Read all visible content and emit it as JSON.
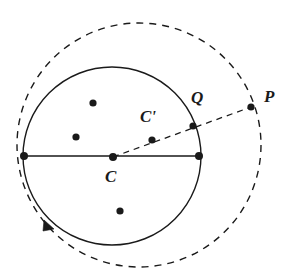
{
  "figure": {
    "background_color": "#ffffff",
    "stroke_color": "#1a1a1a",
    "width": 292,
    "height": 278
  },
  "chart_data": {
    "type": "scatter",
    "title": "",
    "xlabel": "",
    "ylabel": "",
    "grid": false,
    "legend": null,
    "shapes": [
      {
        "name": "solid-circle",
        "kind": "circle",
        "style": "solid",
        "cx": 112,
        "cy": 156,
        "r": 89,
        "stroke": "#1a1a1a",
        "stroke_width": 1.4
      },
      {
        "name": "dashed-circle",
        "kind": "circle",
        "style": "dashed",
        "cx": 139,
        "cy": 145,
        "r": 122,
        "stroke": "#1a1a1a",
        "stroke_width": 1.4
      },
      {
        "name": "diameter-segment",
        "kind": "line",
        "style": "solid",
        "x1": 24,
        "y1": 156,
        "x2": 199,
        "y2": 156,
        "stroke": "#1a1a1a",
        "stroke_width": 1.6
      },
      {
        "name": "dashed-ray-c-to-p",
        "kind": "line",
        "style": "dashed",
        "x1": 113,
        "y1": 157,
        "x2": 251,
        "y2": 107,
        "stroke": "#1a1a1a",
        "stroke_width": 1.3
      },
      {
        "name": "orientation-arrowhead",
        "kind": "arrowhead",
        "x": 52,
        "y": 227,
        "angle_deg": 55,
        "stroke": "#1a1a1a"
      }
    ],
    "points": [
      {
        "name": "point-c",
        "label": "C",
        "x": 113,
        "y": 157,
        "r": 4.0,
        "labeled": true
      },
      {
        "name": "point-c-prime",
        "label": "C'",
        "x": 152,
        "y": 140,
        "r": 3.6,
        "labeled": true
      },
      {
        "name": "point-q",
        "label": "Q",
        "x": 193,
        "y": 126,
        "r": 3.6,
        "labeled": true
      },
      {
        "name": "point-p",
        "label": "P",
        "x": 251,
        "y": 107,
        "r": 3.6,
        "labeled": true
      },
      {
        "name": "point-diameter-left",
        "label": "",
        "x": 24,
        "y": 156,
        "r": 4.0,
        "labeled": false
      },
      {
        "name": "point-diameter-right",
        "label": "",
        "x": 199,
        "y": 156,
        "r": 4.0,
        "labeled": false
      },
      {
        "name": "interior-dot-upper",
        "label": "",
        "x": 93,
        "y": 103,
        "r": 3.6,
        "labeled": false
      },
      {
        "name": "interior-dot-left",
        "label": "",
        "x": 76,
        "y": 137,
        "r": 3.6,
        "labeled": false
      },
      {
        "name": "interior-dot-lower",
        "label": "",
        "x": 120,
        "y": 211,
        "r": 3.6,
        "labeled": false
      }
    ]
  },
  "labels": {
    "c": "C",
    "c_prime": "C'",
    "q": "Q",
    "p": "P"
  }
}
